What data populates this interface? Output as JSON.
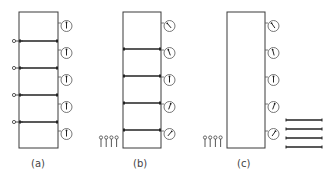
{
  "figure": {
    "panels": [
      {
        "id": "a",
        "label": "(a)",
        "rect": {
          "x": 19,
          "y": 12,
          "w": 39,
          "h": 136
        },
        "dividers_y": [
          41,
          68,
          95,
          122
        ],
        "valves_left": true,
        "gauges": [
          {
            "cy": 26,
            "needle_angle": 0
          },
          {
            "cy": 53,
            "needle_angle": 0
          },
          {
            "cy": 80,
            "needle_angle": 0
          },
          {
            "cy": 107,
            "needle_angle": 0
          },
          {
            "cy": 134,
            "needle_angle": 0
          }
        ],
        "pins": 0,
        "rods": 0
      },
      {
        "id": "b",
        "label": "(b)",
        "rect": {
          "x": 123,
          "y": 12,
          "w": 38,
          "h": 136
        },
        "dividers_y": [
          49,
          76,
          103,
          130
        ],
        "valves_left": false,
        "gauges": [
          {
            "cy": 26,
            "needle_angle": -40
          },
          {
            "cy": 53,
            "needle_angle": -20
          },
          {
            "cy": 80,
            "needle_angle": 0
          },
          {
            "cy": 107,
            "needle_angle": 20
          },
          {
            "cy": 134,
            "needle_angle": 40
          }
        ],
        "pins": 4,
        "rods": 0
      },
      {
        "id": "c",
        "label": "(c)",
        "rect": {
          "x": 227,
          "y": 12,
          "w": 38,
          "h": 136
        },
        "dividers_y": [],
        "valves_left": false,
        "gauges": [
          {
            "cy": 26,
            "needle_angle": -35
          },
          {
            "cy": 53,
            "needle_angle": -15
          },
          {
            "cy": 80,
            "needle_angle": 0
          },
          {
            "cy": 107,
            "needle_angle": 20
          },
          {
            "cy": 134,
            "needle_angle": 35
          }
        ],
        "pins": 4,
        "rods": 4
      }
    ]
  }
}
